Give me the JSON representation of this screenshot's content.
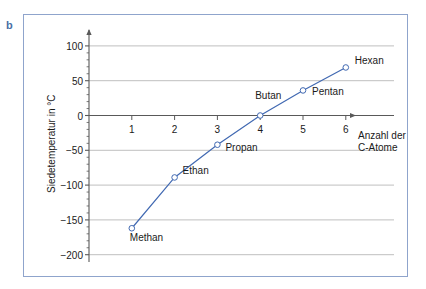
{
  "figure": {
    "panel_label": "b",
    "frame_color": "#8fa4cc",
    "line_color": "#4169b2",
    "marker_color": "#4169b2",
    "grid_color": "#b8b8b8",
    "axis_color": "#595959"
  },
  "chart_data": {
    "type": "line",
    "title": "",
    "xlabel": "Anzahl der C-Atome",
    "xlabel_line1": "Anzahl der",
    "xlabel_line2": "C-Atome",
    "ylabel": "Siedetemperatur in °C",
    "x": [
      1,
      2,
      3,
      4,
      5,
      6
    ],
    "values": [
      -162,
      -89,
      -42,
      0,
      36,
      69
    ],
    "point_labels": [
      "Methan",
      "Ethan",
      "Propan",
      "Butan",
      "Pentan",
      "Hexan"
    ],
    "xlim": [
      0,
      6.6
    ],
    "ylim": [
      -210,
      115
    ],
    "xticks": [
      1,
      2,
      3,
      4,
      5,
      6
    ],
    "xtick_labels": [
      "1",
      "2",
      "3",
      "4",
      "5",
      "6"
    ],
    "yticks": [
      100,
      50,
      0,
      -50,
      -100,
      -150,
      -200
    ],
    "ytick_labels": [
      "100",
      "50",
      "0",
      "−50",
      "−100",
      "−150",
      "−200"
    ],
    "yminor_step": 10,
    "grid": "horizontal",
    "legend": "none",
    "series_name": "Siedetemperatur der Alkane"
  }
}
